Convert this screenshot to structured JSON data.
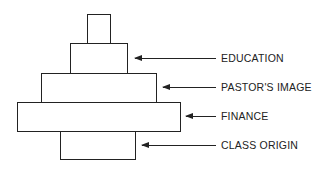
{
  "diagram": {
    "type": "stacked-pyramid",
    "layers": [
      {
        "id": "top",
        "label": ""
      },
      {
        "id": "education",
        "label": "EDUCATION"
      },
      {
        "id": "pastors-image",
        "label": "PASTOR'S IMAGE"
      },
      {
        "id": "finance",
        "label": "FINANCE"
      },
      {
        "id": "class-origin",
        "label": "CLASS ORIGIN"
      }
    ]
  }
}
